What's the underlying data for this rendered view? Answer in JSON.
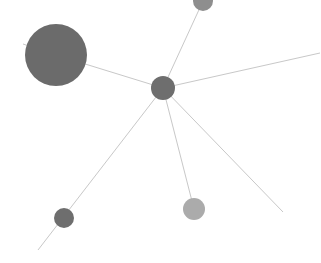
{
  "graph": {
    "background": "#ffffff",
    "edge_color": "#c8c8c8",
    "nodes": [
      {
        "id": "center",
        "x": 163,
        "y": 88,
        "r": 12,
        "color": "#6e6e6e"
      },
      {
        "id": "top",
        "x": 203,
        "y": 1,
        "r": 10,
        "color": "#8e8e8e"
      },
      {
        "id": "large",
        "x": 56,
        "y": 55,
        "r": 31,
        "color": "#6b6b6b"
      },
      {
        "id": "bottom-left",
        "x": 64,
        "y": 218,
        "r": 10,
        "color": "#6e6e6e"
      },
      {
        "id": "bottom-light",
        "x": 194,
        "y": 209,
        "r": 11,
        "color": "#ababab"
      }
    ],
    "edges": [
      {
        "x1": 163,
        "y1": 88,
        "x2": 203,
        "y2": 1
      },
      {
        "x1": 163,
        "y1": 88,
        "x2": 56,
        "y2": 55
      },
      {
        "x1": 56,
        "y1": 55,
        "x2": 23,
        "y2": 44
      },
      {
        "x1": 163,
        "y1": 88,
        "x2": 320,
        "y2": 53
      },
      {
        "x1": 163,
        "y1": 88,
        "x2": 38,
        "y2": 250
      },
      {
        "x1": 163,
        "y1": 88,
        "x2": 194,
        "y2": 209
      },
      {
        "x1": 163,
        "y1": 88,
        "x2": 283,
        "y2": 212
      }
    ]
  }
}
